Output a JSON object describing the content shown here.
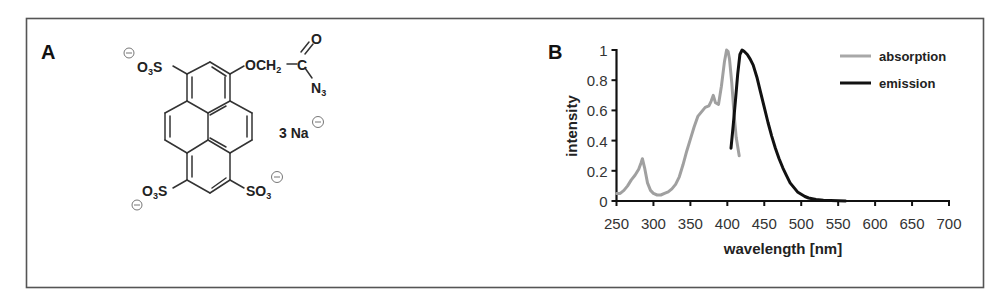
{
  "panel_a": {
    "label": "A",
    "molecule": {
      "sulfonate_top_left": "O3S",
      "ether_group": "OCH2",
      "carbonyl_carbon": "C",
      "carbonyl_oxygen": "O",
      "azide": "N3",
      "counterion": "3 Na",
      "sulfonate_bottom_left": "O3S",
      "sulfonate_bottom_right": "SO3",
      "charge_symbol": "−"
    }
  },
  "panel_b": {
    "label": "B"
  },
  "chart_data": {
    "type": "line",
    "title": "",
    "xlabel": "wavelength [nm]",
    "ylabel": "intensity",
    "xlim": [
      250,
      700
    ],
    "ylim": [
      0,
      1
    ],
    "x_ticks": [
      250,
      300,
      350,
      400,
      450,
      500,
      550,
      600,
      650,
      700
    ],
    "y_ticks": [
      0,
      0.2,
      0.4,
      0.6,
      0.8,
      1
    ],
    "y_tick_labels": [
      "0",
      "0.2",
      "0.4",
      "0.6",
      "0.8",
      "1"
    ],
    "grid": false,
    "legend_position": "upper right",
    "series": [
      {
        "name": "absorption",
        "color": "#a0a0a0",
        "x": [
          250,
          255,
          260,
          265,
          270,
          275,
          280,
          283,
          285,
          288,
          292,
          296,
          300,
          305,
          310,
          315,
          320,
          325,
          330,
          335,
          340,
          345,
          350,
          355,
          360,
          365,
          370,
          375,
          378,
          381,
          384,
          388,
          392,
          396,
          399,
          401,
          403,
          406,
          409,
          412,
          416
        ],
        "y": [
          0.05,
          0.05,
          0.07,
          0.1,
          0.14,
          0.17,
          0.21,
          0.25,
          0.28,
          0.22,
          0.12,
          0.07,
          0.05,
          0.04,
          0.04,
          0.05,
          0.06,
          0.08,
          0.11,
          0.16,
          0.24,
          0.33,
          0.41,
          0.49,
          0.56,
          0.59,
          0.62,
          0.63,
          0.66,
          0.7,
          0.65,
          0.64,
          0.76,
          0.92,
          1.0,
          0.99,
          0.94,
          0.78,
          0.58,
          0.42,
          0.3
        ]
      },
      {
        "name": "emission",
        "color": "#111111",
        "x": [
          405,
          408,
          411,
          414,
          417,
          420,
          423,
          427,
          431,
          435,
          440,
          445,
          450,
          455,
          460,
          465,
          470,
          475,
          480,
          485,
          490,
          495,
          500,
          505,
          510,
          520,
          530,
          540,
          550,
          560
        ],
        "y": [
          0.35,
          0.5,
          0.67,
          0.84,
          0.97,
          1.0,
          0.99,
          0.97,
          0.94,
          0.9,
          0.82,
          0.72,
          0.62,
          0.52,
          0.43,
          0.35,
          0.28,
          0.22,
          0.17,
          0.12,
          0.09,
          0.06,
          0.045,
          0.03,
          0.02,
          0.01,
          0.005,
          0.003,
          0.002,
          0.0
        ]
      }
    ]
  }
}
